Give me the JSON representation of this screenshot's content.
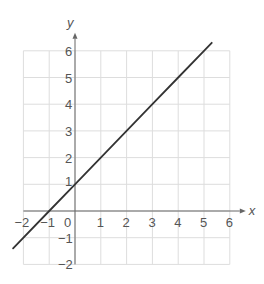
{
  "chart_data": {
    "type": "line",
    "title": "",
    "xlabel": "x",
    "ylabel": "y",
    "xlim": [
      -2,
      6
    ],
    "ylim": [
      -2,
      6
    ],
    "grid": true,
    "x_ticks": [
      "−2",
      "−1",
      "0",
      "1",
      "2",
      "3",
      "4",
      "5",
      "6"
    ],
    "y_ticks": [
      "−2",
      "−1",
      "1",
      "2",
      "3",
      "4",
      "5",
      "6"
    ],
    "series": [
      {
        "name": "y = x + 1",
        "equation": "y = x + 1",
        "x": [
          -2.4,
          -1,
          0,
          1,
          2,
          3,
          4,
          5,
          5.3
        ],
        "y": [
          -1.4,
          0,
          1,
          2,
          3,
          4,
          5,
          6,
          6.3
        ]
      }
    ],
    "colors": {
      "line": "#333333",
      "grid": "#dddddd",
      "axis": "#666666",
      "text": "#555555"
    }
  }
}
